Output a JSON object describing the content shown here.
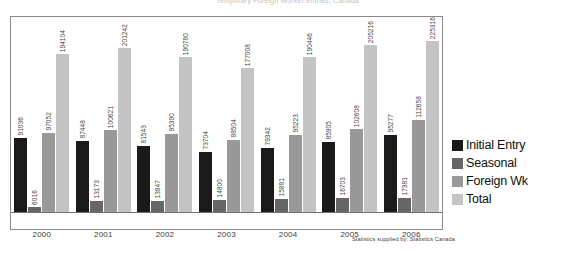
{
  "title_strip": "Temporary Foreign Worker entries, Canada",
  "footer_note": "Statistics supplied by: Statistics Canada",
  "legend": {
    "items": [
      {
        "label": "Initial Entry",
        "color": "#1a1a1a"
      },
      {
        "label": "Seasonal",
        "color": "#666666"
      },
      {
        "label": "Foreign Wk",
        "color": "#999999"
      },
      {
        "label": "Total",
        "color": "#c4c4c4"
      }
    ]
  },
  "chart_data": {
    "type": "bar",
    "title": "",
    "xlabel": "",
    "ylabel": "",
    "grid": false,
    "legend_position": "right",
    "ylim": [
      0,
      240000
    ],
    "categories": [
      "2000",
      "2001",
      "2002",
      "2003",
      "2004",
      "2005",
      "2006"
    ],
    "series": [
      {
        "name": "Initial Entry",
        "color": "#1a1a1a",
        "values": [
          91036,
          87448,
          81543,
          73704,
          79342,
          85905,
          95277
        ]
      },
      {
        "name": "Seasonal",
        "color": "#666666",
        "values": [
          6016,
          13173,
          13847,
          14800,
          15881,
          16703,
          17381
        ]
      },
      {
        "name": "Foreign Wk",
        "color": "#999999",
        "values": [
          97052,
          100621,
          95390,
          88504,
          95223,
          102608,
          112658
        ]
      },
      {
        "name": "Total",
        "color": "#c4c4c4",
        "values": [
          194104,
          201242,
          190780,
          177008,
          190446,
          205216,
          225316
        ]
      }
    ]
  }
}
